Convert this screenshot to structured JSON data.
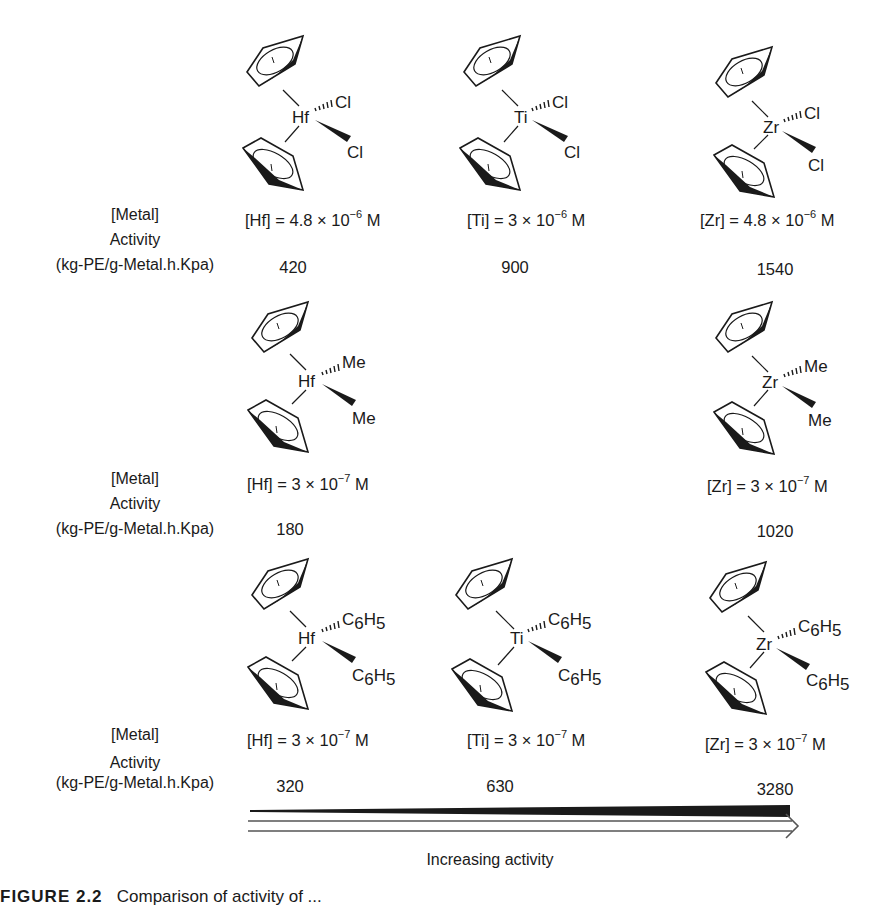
{
  "row_labels": {
    "metal": "[Metal]",
    "activity": "Activity",
    "units": "(kg-PE/g-Metal.h.Kpa)"
  },
  "rows": [
    {
      "ligand": "Cl",
      "complexes": [
        {
          "metal": "Hf",
          "ligand_top": "Cl",
          "ligand_bottom": "Cl",
          "conc_prefix": "[Hf] = 4.8 × 10",
          "conc_exp": "−6",
          "conc_unit": " M",
          "activity": "420"
        },
        {
          "metal": "Ti",
          "ligand_top": "Cl",
          "ligand_bottom": "Cl",
          "conc_prefix": "[Ti] = 3 × 10",
          "conc_exp": "−6",
          "conc_unit": " M",
          "activity": "900"
        },
        {
          "metal": "Zr",
          "ligand_top": "Cl",
          "ligand_bottom": "Cl",
          "conc_prefix": "[Zr] = 4.8 × 10",
          "conc_exp": "−6",
          "conc_unit": " M",
          "activity": "1540"
        }
      ]
    },
    {
      "ligand": "Me",
      "complexes": [
        {
          "metal": "Hf",
          "ligand_top": "Me",
          "ligand_bottom": "Me",
          "conc_prefix": "[Hf] = 3 × 10",
          "conc_exp": "−7",
          "conc_unit": " M",
          "activity": "180"
        },
        {
          "metal": "Zr",
          "ligand_top": "Me",
          "ligand_bottom": "Me",
          "conc_prefix": "[Zr] = 3 × 10",
          "conc_exp": "−7",
          "conc_unit": " M",
          "activity": "1020"
        }
      ]
    },
    {
      "ligand": "C6H5",
      "complexes": [
        {
          "metal": "Hf",
          "ligand_main": "C",
          "ligand_sub1": "6",
          "ligand_mid": "H",
          "ligand_sub2": "5",
          "conc_prefix": "[Hf] = 3 × 10",
          "conc_exp": "−7",
          "conc_unit": " M",
          "activity": "320"
        },
        {
          "metal": "Ti",
          "ligand_main": "C",
          "ligand_sub1": "6",
          "ligand_mid": "H",
          "ligand_sub2": "5",
          "conc_prefix": "[Ti] = 3 × 10",
          "conc_exp": "−7",
          "conc_unit": " M",
          "activity": "630"
        },
        {
          "metal": "Zr",
          "ligand_main": "C",
          "ligand_sub1": "6",
          "ligand_mid": "H",
          "ligand_sub2": "5",
          "conc_prefix": "[Zr] = 3 × 10",
          "conc_exp": "−7",
          "conc_unit": " M",
          "activity": "3280"
        }
      ]
    }
  ],
  "arrow": {
    "label": "Increasing activity"
  },
  "caption": {
    "figure_label": "FIGURE 2.2",
    "text": "Comparison of activity of ..."
  },
  "colors": {
    "ink": "#1a1a1a",
    "background": "#ffffff"
  }
}
